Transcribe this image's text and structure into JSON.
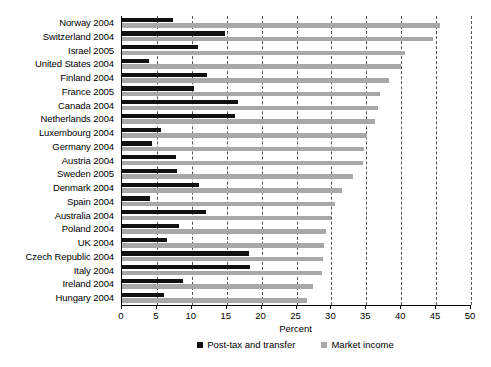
{
  "chart_data": {
    "type": "bar",
    "orientation": "horizontal",
    "title": "",
    "xlabel": "Percent",
    "ylabel": "",
    "xlim": [
      0,
      50
    ],
    "xticks": [
      0,
      5,
      10,
      15,
      20,
      25,
      30,
      35,
      40,
      45,
      50
    ],
    "grid": "vertical-dashed",
    "legend_position": "bottom-center",
    "categories": [
      "Norway 2004",
      "Switzerland 2004",
      "Israel 2005",
      "United States 2004",
      "Finland 2004",
      "France 2005",
      "Canada 2004",
      "Netherlands 2004",
      "Luxembourg 2004",
      "Germany 2004",
      "Austria 2004",
      "Sweden 2005",
      "Denmark 2004",
      "Spain 2004",
      "Australia 2004",
      "Poland 2004",
      "UK 2004",
      "Czech Republic 2004",
      "Italy 2004",
      "Ireland 2004",
      "Hungary 2004"
    ],
    "series": [
      {
        "name": "Post-tax and transfer",
        "color": "#111111",
        "values": [
          7.3,
          14.7,
          10.9,
          3.9,
          12.2,
          10.3,
          16.6,
          16.2,
          5.6,
          4.3,
          7.7,
          7.9,
          11.1,
          4.0,
          12.0,
          8.1,
          6.4,
          18.2,
          18.3,
          8.8,
          6.0
        ]
      },
      {
        "name": "Market income",
        "color": "#a8a8a8",
        "values": [
          45.6,
          44.6,
          40.6,
          39.9,
          38.2,
          37.0,
          36.7,
          36.2,
          35.1,
          34.6,
          34.5,
          33.1,
          31.5,
          30.5,
          30.0,
          29.2,
          28.9,
          28.8,
          28.6,
          27.4,
          26.5
        ]
      }
    ]
  }
}
